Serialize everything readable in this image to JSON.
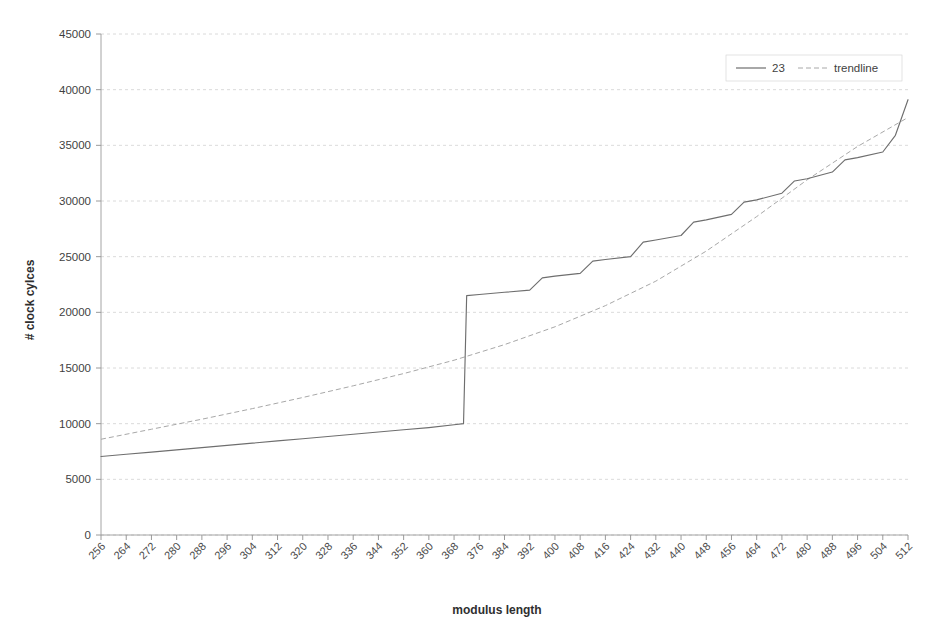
{
  "chart_data": {
    "type": "line",
    "title": "",
    "xlabel": "modulus length",
    "ylabel": "# clock cylces",
    "xlim": [
      256,
      512
    ],
    "ylim": [
      0,
      45000
    ],
    "grid": true,
    "legend_position": "top-right",
    "x_tick_labels": [
      "256",
      "264",
      "272",
      "280",
      "288",
      "296",
      "304",
      "312",
      "320",
      "328",
      "336",
      "344",
      "352",
      "360",
      "368",
      "376",
      "384",
      "392",
      "400",
      "408",
      "416",
      "424",
      "432",
      "440",
      "448",
      "456",
      "464",
      "472",
      "480",
      "488",
      "496",
      "504",
      "512"
    ],
    "y_tick_labels": [
      "0",
      "5000",
      "10000",
      "15000",
      "20000",
      "25000",
      "30000",
      "35000",
      "40000",
      "45000"
    ],
    "y_tick_values": [
      0,
      5000,
      10000,
      15000,
      20000,
      25000,
      30000,
      35000,
      40000,
      45000
    ],
    "series": [
      {
        "name": "23",
        "style": "solid",
        "color": "#6e6e6e",
        "x": [
          256,
          264,
          272,
          280,
          288,
          296,
          304,
          312,
          320,
          328,
          336,
          344,
          352,
          360,
          368,
          371,
          372,
          376,
          384,
          392,
          396,
          400,
          408,
          412,
          416,
          424,
          428,
          432,
          440,
          444,
          448,
          456,
          460,
          464,
          472,
          476,
          480,
          488,
          492,
          496,
          504,
          508,
          512
        ],
        "values": [
          7050,
          7250,
          7450,
          7650,
          7850,
          8050,
          8250,
          8450,
          8650,
          8850,
          9050,
          9250,
          9450,
          9650,
          9900,
          10000,
          21500,
          21600,
          21800,
          22000,
          23100,
          23250,
          23500,
          24600,
          24750,
          25000,
          26300,
          26500,
          26900,
          28100,
          28300,
          28800,
          29900,
          30100,
          30700,
          31800,
          32000,
          32600,
          33700,
          33900,
          34400,
          35900,
          39100
        ]
      },
      {
        "name": "trendline",
        "style": "dashed",
        "color": "#a8a8a8",
        "x": [
          256,
          272,
          288,
          304,
          320,
          336,
          352,
          368,
          384,
          400,
          416,
          432,
          448,
          464,
          480,
          496,
          512
        ],
        "values": [
          8600,
          9500,
          10400,
          11350,
          12350,
          13400,
          14500,
          15700,
          17100,
          18700,
          20600,
          22800,
          25500,
          28600,
          31900,
          34900,
          37500
        ]
      }
    ]
  },
  "legend": {
    "entries": [
      {
        "label": "23",
        "style": "solid"
      },
      {
        "label": "trendline",
        "style": "dashed"
      }
    ]
  }
}
